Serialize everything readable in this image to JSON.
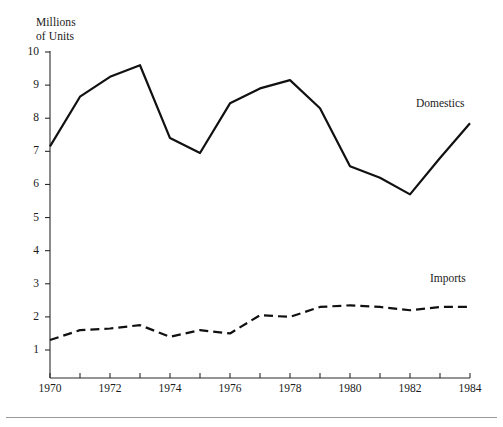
{
  "chart_data": {
    "type": "line",
    "title": "",
    "subtitle": "",
    "xlabel": "",
    "ylabel": "Millions\nof Units",
    "x": [
      1970,
      1971,
      1972,
      1973,
      1974,
      1975,
      1976,
      1977,
      1978,
      1979,
      1980,
      1981,
      1982,
      1983,
      1984
    ],
    "xlim": [
      1970,
      1984
    ],
    "ylim": [
      0.6,
      10.2
    ],
    "grid": false,
    "legend_position": "inline-right",
    "x_tick_labels": [
      "1970",
      "1972",
      "1974",
      "1976",
      "1978",
      "1980",
      "1982",
      "1984"
    ],
    "x_tick_values": [
      1970,
      1972,
      1974,
      1976,
      1978,
      1980,
      1982,
      1984
    ],
    "x_minor_tick_values": [
      1971,
      1973,
      1975,
      1977,
      1979,
      1981,
      1983
    ],
    "y_tick_labels": [
      "1",
      "2",
      "3",
      "4",
      "5",
      "6",
      "7",
      "8",
      "9",
      "10"
    ],
    "y_tick_values": [
      1,
      2,
      3,
      4,
      5,
      6,
      7,
      8,
      9,
      10
    ],
    "series": [
      {
        "name": "Domestics",
        "style": "solid",
        "color": "#111111",
        "width": 2.2,
        "values": [
          7.15,
          8.65,
          9.25,
          9.6,
          7.4,
          6.95,
          8.45,
          8.9,
          9.15,
          8.3,
          6.55,
          6.2,
          5.7,
          6.8,
          7.85
        ]
      },
      {
        "name": "Imports",
        "style": "dashed",
        "color": "#111111",
        "width": 2.2,
        "values": [
          1.3,
          1.6,
          1.65,
          1.75,
          1.4,
          1.6,
          1.5,
          2.05,
          2.0,
          2.3,
          2.35,
          2.3,
          2.2,
          2.3,
          2.3
        ]
      }
    ]
  },
  "annotations": {
    "domestics_label": "Domestics",
    "imports_label": "Imports"
  },
  "axis": {
    "y_title_line1": "Millions",
    "y_title_line2": "of Units",
    "y_title": "Millions\nof Units"
  },
  "colors": {
    "line": "#111111",
    "axis": "#2b2b2b",
    "text": "#1a1a1a",
    "footer_rule": "#999999",
    "background": "#ffffff"
  }
}
